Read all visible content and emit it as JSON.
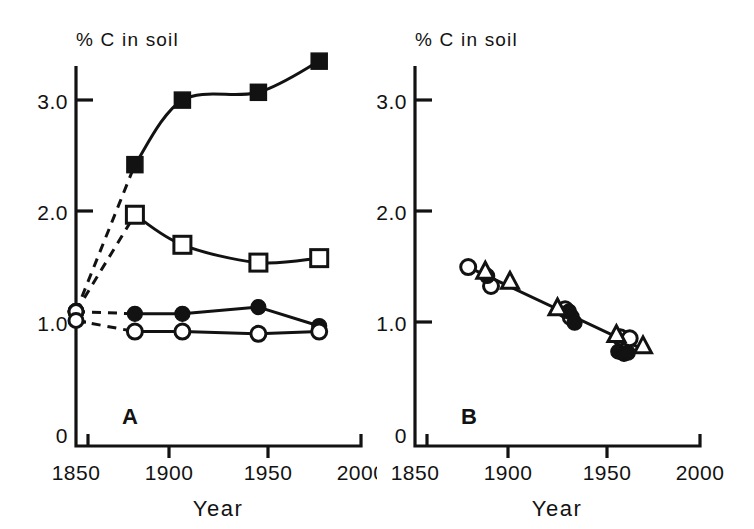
{
  "figure": {
    "background": "#ffffff",
    "ink": "#121212",
    "width": 754,
    "height": 529
  },
  "panels": [
    {
      "id": "A",
      "letter": "A",
      "axis_title": "% C in soil",
      "xlabel": "Year",
      "yticks": [
        "3.0",
        "2.0",
        "1.0",
        "0"
      ],
      "ytick_values": [
        3.0,
        2.0,
        1.0,
        0
      ],
      "xticks": [
        "1850",
        "1900",
        "1950",
        "2000"
      ],
      "xtick_values": [
        1850,
        1900,
        1950,
        2000
      ]
    },
    {
      "id": "B",
      "letter": "B",
      "axis_title": "% C in soil",
      "xlabel": "Year",
      "yticks": [
        "3.0",
        "2.0",
        "1.0",
        "0"
      ],
      "ytick_values": [
        3.0,
        2.0,
        1.0,
        0
      ],
      "xticks": [
        "1850",
        "1900",
        "1950",
        "2000"
      ],
      "xtick_values": [
        1850,
        1900,
        1950,
        2000
      ]
    }
  ],
  "chart_data": [
    {
      "panel": "A",
      "type": "line",
      "title": "% C in soil",
      "xlabel": "Year",
      "ylabel": "% C in soil",
      "xlim": [
        1850,
        2000
      ],
      "ylim": [
        0,
        3.6
      ],
      "xticks": [
        1850,
        1900,
        1950,
        2000
      ],
      "yticks": [
        0,
        1.0,
        2.0,
        3.0
      ],
      "grid": false,
      "legend": "none",
      "series": [
        {
          "name": "filled-square",
          "marker": "filled-square",
          "line": "solid-curve",
          "origin_dashed_from": {
            "x": 1850,
            "y": 1.1
          },
          "x": [
            1881,
            1906,
            1946,
            1978
          ],
          "y": [
            2.42,
            3.0,
            3.07,
            3.35
          ]
        },
        {
          "name": "open-square",
          "marker": "open-square",
          "line": "solid-curve",
          "origin_dashed_from": {
            "x": 1850,
            "y": 1.1
          },
          "x": [
            1881,
            1906,
            1946,
            1978
          ],
          "y": [
            1.97,
            1.7,
            1.54,
            1.58
          ]
        },
        {
          "name": "filled-circle",
          "marker": "filled-circle",
          "line": "solid",
          "origin_dashed_from": {
            "x": 1850,
            "y": 1.1
          },
          "x": [
            1881,
            1906,
            1946,
            1978
          ],
          "y": [
            1.08,
            1.08,
            1.14,
            0.97
          ]
        },
        {
          "name": "open-circle",
          "marker": "open-circle",
          "line": "solid",
          "origin_dashed_from": {
            "x": 1850,
            "y": 1.02
          },
          "x": [
            1881,
            1906,
            1946,
            1978
          ],
          "y": [
            0.92,
            0.92,
            0.9,
            0.92
          ]
        }
      ]
    },
    {
      "panel": "B",
      "type": "scatter",
      "title": "% C in soil",
      "xlabel": "Year",
      "ylabel": "% C in soil",
      "xlim": [
        1850,
        2000
      ],
      "ylim": [
        0,
        3.6
      ],
      "xticks": [
        1850,
        1900,
        1950,
        2000
      ],
      "yticks": [
        0,
        1.0,
        2.0,
        3.0
      ],
      "grid": false,
      "legend": "none",
      "regression_line": {
        "x": [
          1878,
          1970
        ],
        "y": [
          1.5,
          0.76
        ]
      },
      "series": [
        {
          "name": "open-circle",
          "marker": "open-circle",
          "x": [
            1878,
            1890,
            1929,
            1932,
            1958,
            1963
          ],
          "y": [
            1.5,
            1.33,
            1.12,
            1.05,
            0.87,
            0.86
          ]
        },
        {
          "name": "filled-circle",
          "marker": "filled-circle",
          "x": [
            1888,
            1931,
            1934,
            1957,
            1960,
            1962
          ],
          "y": [
            1.42,
            1.1,
            1.0,
            0.74,
            0.72,
            0.73
          ]
        },
        {
          "name": "open-triangle",
          "marker": "open-triangle",
          "x": [
            1887,
            1900,
            1925,
            1956,
            1970
          ],
          "y": [
            1.46,
            1.37,
            1.13,
            0.89,
            0.79
          ]
        }
      ]
    }
  ]
}
